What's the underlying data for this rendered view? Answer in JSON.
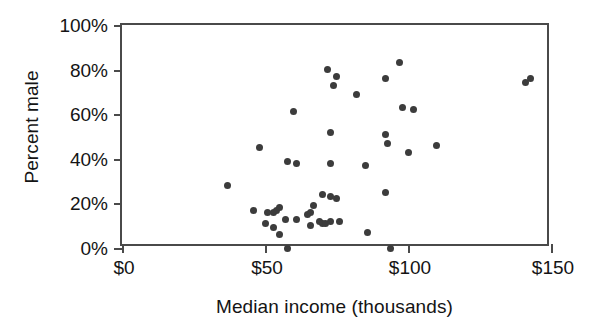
{
  "chart_data": {
    "type": "scatter",
    "title": "",
    "xlabel": "Median income (thousands)",
    "ylabel": "Percent male",
    "xlim": [
      0,
      150
    ],
    "ylim": [
      0,
      100
    ],
    "grid": false,
    "legend": null,
    "xticks": [
      {
        "value": 0,
        "label": "$0"
      },
      {
        "value": 50,
        "label": "$50"
      },
      {
        "value": 100,
        "label": "$100"
      },
      {
        "value": 150,
        "label": "$150"
      }
    ],
    "yticks": [
      {
        "value": 0,
        "label": "0%"
      },
      {
        "value": 20,
        "label": "20%"
      },
      {
        "value": 40,
        "label": "40%"
      },
      {
        "value": 60,
        "label": "60%"
      },
      {
        "value": 80,
        "label": "80%"
      },
      {
        "value": 100,
        "label": "100%"
      }
    ],
    "marker": {
      "shape": "circle",
      "color": "#3c3c3c",
      "size": 7
    },
    "axis_color": "#4a4a4a",
    "point_count": 48,
    "points": [
      {
        "x": 37,
        "y": 28
      },
      {
        "x": 46,
        "y": 17
      },
      {
        "x": 48,
        "y": 45
      },
      {
        "x": 50,
        "y": 11
      },
      {
        "x": 51,
        "y": 16
      },
      {
        "x": 53,
        "y": 9
      },
      {
        "x": 53,
        "y": 16
      },
      {
        "x": 54,
        "y": 17
      },
      {
        "x": 55,
        "y": 18
      },
      {
        "x": 55,
        "y": 6
      },
      {
        "x": 57,
        "y": 13
      },
      {
        "x": 58,
        "y": 0
      },
      {
        "x": 58,
        "y": 39
      },
      {
        "x": 60,
        "y": 61
      },
      {
        "x": 61,
        "y": 38
      },
      {
        "x": 61,
        "y": 13
      },
      {
        "x": 65,
        "y": 15
      },
      {
        "x": 66,
        "y": 16
      },
      {
        "x": 66,
        "y": 10
      },
      {
        "x": 67,
        "y": 19
      },
      {
        "x": 69,
        "y": 12
      },
      {
        "x": 70,
        "y": 24
      },
      {
        "x": 70,
        "y": 11
      },
      {
        "x": 71,
        "y": 11
      },
      {
        "x": 72,
        "y": 80
      },
      {
        "x": 73,
        "y": 12
      },
      {
        "x": 73,
        "y": 52
      },
      {
        "x": 73,
        "y": 38
      },
      {
        "x": 73,
        "y": 23
      },
      {
        "x": 74,
        "y": 73
      },
      {
        "x": 75,
        "y": 77
      },
      {
        "x": 75,
        "y": 22
      },
      {
        "x": 76,
        "y": 12
      },
      {
        "x": 82,
        "y": 69
      },
      {
        "x": 85,
        "y": 37
      },
      {
        "x": 86,
        "y": 7
      },
      {
        "x": 92,
        "y": 51
      },
      {
        "x": 92,
        "y": 76
      },
      {
        "x": 93,
        "y": 47
      },
      {
        "x": 94,
        "y": 0
      },
      {
        "x": 92,
        "y": 25
      },
      {
        "x": 97,
        "y": 83
      },
      {
        "x": 98,
        "y": 63
      },
      {
        "x": 100,
        "y": 43
      },
      {
        "x": 102,
        "y": 62
      },
      {
        "x": 110,
        "y": 46
      },
      {
        "x": 141,
        "y": 74
      },
      {
        "x": 143,
        "y": 76
      }
    ]
  }
}
